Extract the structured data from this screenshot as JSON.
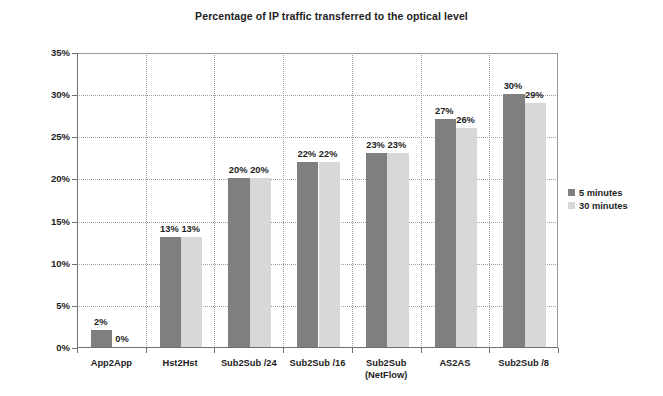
{
  "chart_data": {
    "type": "bar",
    "title": "Percentage of IP traffic transferred to the optical level",
    "xlabel": "",
    "ylabel": "",
    "ylim": [
      0,
      35
    ],
    "ytick_labels": [
      "0%",
      "5%",
      "10%",
      "15%",
      "20%",
      "25%",
      "30%",
      "35%"
    ],
    "ytick_values": [
      0,
      5,
      10,
      15,
      20,
      25,
      30,
      35
    ],
    "grid": true,
    "legend_position": "right",
    "categories": [
      "App2App",
      "Hst2Hst",
      "Sub2Sub /24",
      "Sub2Sub /16",
      "Sub2Sub\n(NetFlow)",
      "AS2AS",
      "Sub2Sub /8"
    ],
    "series": [
      {
        "name": "5 minutes",
        "color": "#7f7f7f",
        "values": [
          2,
          13,
          20,
          22,
          23,
          27,
          30
        ],
        "labels": [
          "2%",
          "13%",
          "20%",
          "22%",
          "23%",
          "27%",
          "30%"
        ]
      },
      {
        "name": "30 minutes",
        "color": "#d8d8d8",
        "values": [
          0,
          13,
          20,
          22,
          23,
          26,
          29
        ],
        "labels": [
          "0%",
          "13%",
          "20%",
          "22%",
          "23%",
          "26%",
          "29%"
        ]
      }
    ]
  }
}
